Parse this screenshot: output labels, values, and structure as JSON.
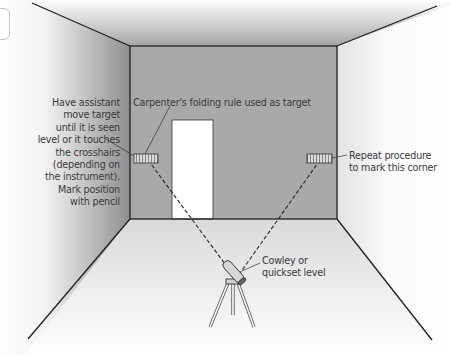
{
  "diagram": {
    "labels": {
      "left_instruction": [
        "Have assistant",
        "move target",
        "until it is seen",
        "level or it touches",
        "the crosshairs",
        "(depending on",
        "the instrument).",
        "Mark position",
        "with pencil"
      ],
      "target": "Carpenter's folding rule used as target",
      "right_instruction": [
        "Repeat procedure",
        "to mark this corner"
      ],
      "instrument": [
        "Cowley or",
        "quickset level"
      ]
    },
    "elements": {
      "back_wall": "back-wall",
      "door": "doorway",
      "left_target": "folding-rule-left",
      "right_target": "folding-rule-right",
      "level": "cowley-level-on-tripod",
      "sight_lines": "dashed-sight-lines"
    },
    "colors": {
      "back_wall": "#a9a9a9",
      "ceiling_dark": "#a0a0a0",
      "side_wall_dark": "#8e8e8e",
      "floor": "#e4e4e4",
      "door": "#ffffff",
      "line": "#1e1e1e",
      "text": "#3a3a3a"
    }
  }
}
